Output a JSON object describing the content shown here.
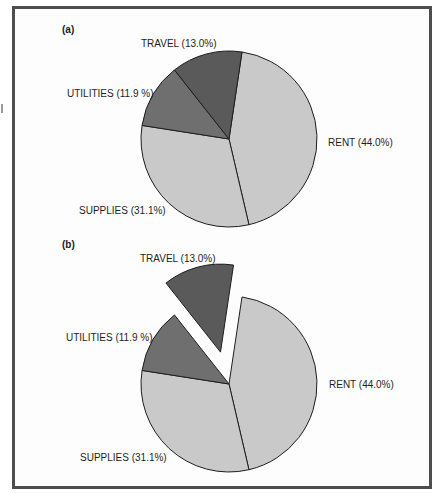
{
  "chart_data": [
    {
      "type": "pie",
      "panel": "(a)",
      "title": "",
      "categories": [
        "RENT",
        "SUPPLIES",
        "UTILITIES",
        "TRAVEL"
      ],
      "values": [
        44.0,
        31.1,
        11.9,
        13.0
      ],
      "labels": [
        "RENT (44.0%)",
        "SUPPLIES (31.1%)",
        "UTILITIES (11.9 %)",
        "TRAVEL (13.0%)"
      ],
      "colors": [
        "#c9c9c9",
        "#c9c9c9",
        "#6f6f6f",
        "#5a5a5a"
      ],
      "exploded": [],
      "start_angle_deg_clockwise_from_top": 8.5
    },
    {
      "type": "pie",
      "panel": "(b)",
      "title": "",
      "categories": [
        "RENT",
        "SUPPLIES",
        "UTILITIES",
        "TRAVEL"
      ],
      "values": [
        44.0,
        31.1,
        11.9,
        13.0
      ],
      "labels": [
        "RENT (44.0%)",
        "SUPPLIES (31.1%)",
        "UTILITIES (11.9 %)",
        "TRAVEL (13.0%)"
      ],
      "colors": [
        "#c9c9c9",
        "#c9c9c9",
        "#6f6f6f",
        "#5a5a5a"
      ],
      "exploded": [
        "TRAVEL"
      ],
      "start_angle_deg_clockwise_from_top": 8.5
    }
  ],
  "panels": {
    "a": {
      "label": "(a)",
      "travel": "TRAVEL (13.0%)",
      "utilities": "UTILITIES (11.9 %)",
      "rent": "RENT (44.0%)",
      "supplies": "SUPPLIES (31.1%)"
    },
    "b": {
      "label": "(b)",
      "travel": "TRAVEL (13.0%)",
      "utilities": "UTILITIES (11.9 %)",
      "rent": "RENT (44.0%)",
      "supplies": "SUPPLIES (31.1%)"
    }
  }
}
